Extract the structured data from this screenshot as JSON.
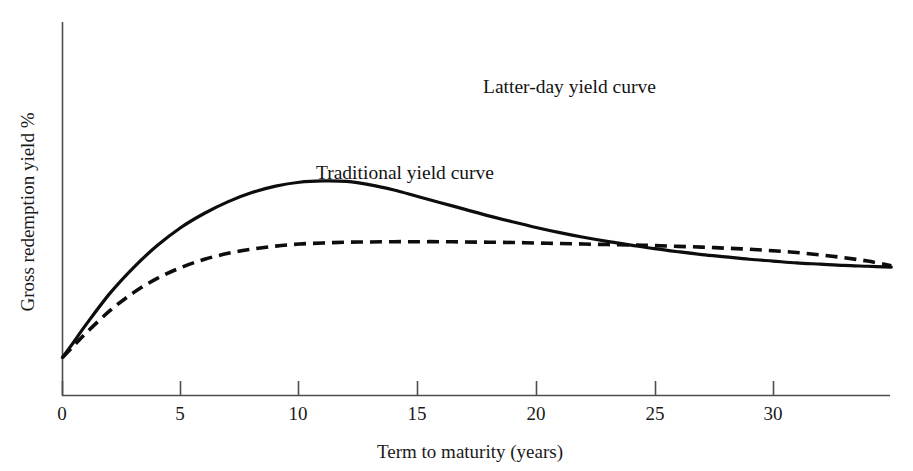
{
  "chart_data": {
    "type": "line",
    "title": "",
    "xlabel": "Term to maturity (years)",
    "ylabel": "Gross redemption yield %",
    "xlim": [
      0,
      35
    ],
    "ylim": [
      0,
      10
    ],
    "xticks": [
      0,
      5,
      10,
      15,
      20,
      25,
      30
    ],
    "xtick_labels": [
      "0",
      "5",
      "10",
      "15",
      "20",
      "25",
      "30"
    ],
    "yticks": [],
    "ytick_labels": [],
    "grid": false,
    "legend_position": "inline-annotation",
    "series": [
      {
        "name": "Latter-day yield curve",
        "style": "dashed",
        "color": "#0d0d0d",
        "x": [
          0,
          0.5,
          1,
          2,
          3,
          4,
          5,
          6,
          7,
          8,
          9,
          10,
          11,
          12,
          13,
          14,
          15,
          16,
          17,
          18,
          19,
          20,
          21,
          22,
          23,
          24,
          25,
          26,
          27,
          28,
          29,
          30,
          31,
          32,
          33,
          34,
          35
        ],
        "y": [
          1.47,
          2.1,
          2.75,
          3.95,
          4.95,
          5.8,
          6.5,
          7.05,
          7.5,
          7.85,
          8.1,
          8.25,
          8.3,
          8.28,
          8.15,
          7.95,
          7.7,
          7.45,
          7.2,
          6.95,
          6.72,
          6.5,
          6.3,
          6.12,
          5.96,
          5.82,
          5.68,
          5.56,
          5.45,
          5.36,
          5.27,
          5.2,
          5.13,
          5.08,
          5.03,
          5.0,
          4.97
        ]
      },
      {
        "name": "Traditional yield curve",
        "style": "solid",
        "color": "#0d0d0d",
        "x": [
          0,
          0.5,
          1,
          2,
          3,
          4,
          5,
          6,
          7,
          8,
          9,
          10,
          11,
          12,
          13,
          14,
          15,
          16,
          17,
          18,
          19,
          20,
          21,
          22,
          23,
          24,
          25,
          26,
          27,
          28,
          29,
          30,
          31,
          32,
          33,
          34,
          35
        ],
        "y": [
          1.47,
          1.95,
          2.42,
          3.28,
          3.98,
          4.53,
          4.95,
          5.27,
          5.5,
          5.66,
          5.78,
          5.86,
          5.9,
          5.93,
          5.94,
          5.95,
          5.95,
          5.95,
          5.94,
          5.93,
          5.92,
          5.9,
          5.88,
          5.86,
          5.84,
          5.82,
          5.8,
          5.77,
          5.74,
          5.7,
          5.66,
          5.6,
          5.53,
          5.44,
          5.33,
          5.2,
          5.02
        ]
      }
    ],
    "annotations": [
      {
        "text": "Latter-day yield curve",
        "x": 483,
        "y": 93
      },
      {
        "text": "Traditional yield curve",
        "x": 316,
        "y": 179
      }
    ]
  }
}
